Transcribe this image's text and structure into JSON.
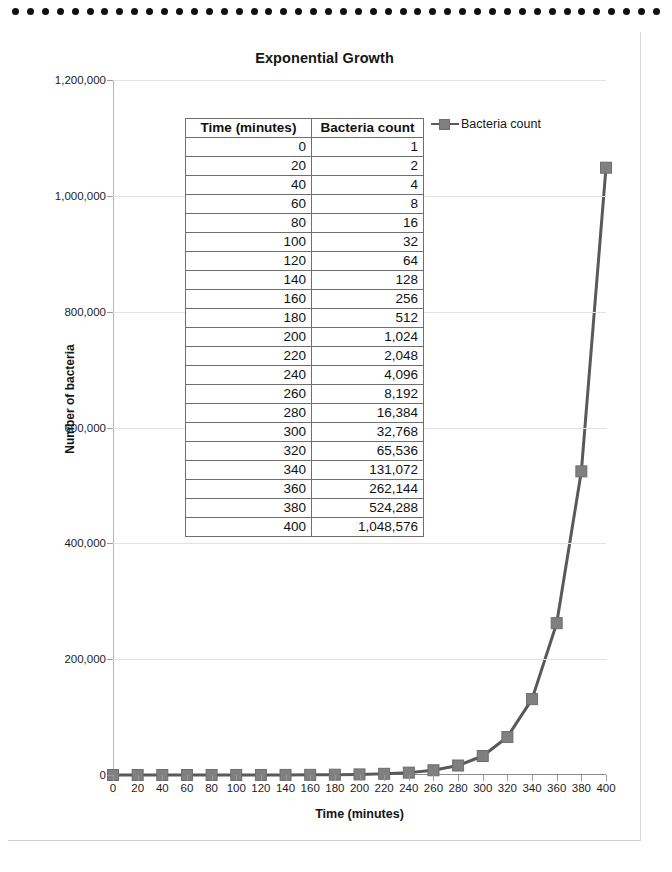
{
  "page": {
    "binding_hole_count": 44,
    "binding_hole_color": "#111111"
  },
  "chart": {
    "title": "Exponential Growth",
    "legend": {
      "position": "top-right",
      "entries": [
        {
          "label": "Bacteria count",
          "marker": "square-marker",
          "color": "#808080",
          "line_color": "#595959"
        }
      ]
    }
  },
  "chart_data": {
    "type": "line",
    "title": "Exponential Growth",
    "xlabel": "Time (minutes)",
    "ylabel": "Number of bacteria",
    "xlim": [
      0,
      400
    ],
    "ylim": [
      0,
      1200000
    ],
    "xticks": [
      0,
      20,
      40,
      60,
      80,
      100,
      120,
      140,
      160,
      180,
      200,
      220,
      240,
      260,
      280,
      300,
      320,
      340,
      360,
      380,
      400
    ],
    "xticklabels": [
      "0",
      "20",
      "40",
      "60",
      "80",
      "100",
      "120",
      "140",
      "160",
      "180",
      "200",
      "220",
      "240",
      "260",
      "280",
      "300",
      "320",
      "340",
      "360",
      "380",
      "400"
    ],
    "yticks": [
      0,
      200000,
      400000,
      600000,
      800000,
      1000000,
      1200000
    ],
    "yticklabels": [
      "0",
      "200,000",
      "400,000",
      "600,000",
      "800,000",
      "1,000,000",
      "1,200,000"
    ],
    "grid": "horizontal",
    "legend_position": "upper right",
    "x": [
      0,
      20,
      40,
      60,
      80,
      100,
      120,
      140,
      160,
      180,
      200,
      220,
      240,
      260,
      280,
      300,
      320,
      340,
      360,
      380,
      400
    ],
    "series": [
      {
        "name": "Bacteria count",
        "marker": "square",
        "color": "#595959",
        "marker_color": "#808080",
        "values": [
          1,
          2,
          4,
          8,
          16,
          32,
          64,
          128,
          256,
          512,
          1024,
          2048,
          4096,
          8192,
          16384,
          32768,
          65536,
          131072,
          262144,
          524288,
          1048576
        ]
      }
    ]
  },
  "table": {
    "headers": [
      "Time (minutes)",
      "Bacteria count"
    ],
    "rows": [
      [
        "0",
        "1"
      ],
      [
        "20",
        "2"
      ],
      [
        "40",
        "4"
      ],
      [
        "60",
        "8"
      ],
      [
        "80",
        "16"
      ],
      [
        "100",
        "32"
      ],
      [
        "120",
        "64"
      ],
      [
        "140",
        "128"
      ],
      [
        "160",
        "256"
      ],
      [
        "180",
        "512"
      ],
      [
        "200",
        "1,024"
      ],
      [
        "220",
        "2,048"
      ],
      [
        "240",
        "4,096"
      ],
      [
        "260",
        "8,192"
      ],
      [
        "280",
        "16,384"
      ],
      [
        "300",
        "32,768"
      ],
      [
        "320",
        "65,536"
      ],
      [
        "340",
        "131,072"
      ],
      [
        "360",
        "262,144"
      ],
      [
        "380",
        "524,288"
      ],
      [
        "400",
        "1,048,576"
      ]
    ]
  }
}
